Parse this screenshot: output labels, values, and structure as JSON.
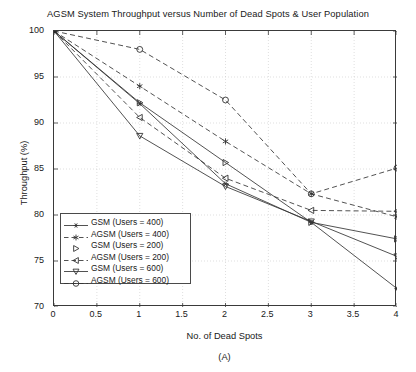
{
  "chart_data": {
    "type": "line",
    "title": "AGSM System Throughput versus Number of Dead Spots & User Population",
    "xlabel": "No. of Dead Spots",
    "ylabel": "Throughput (%)",
    "sub_caption": "(A)",
    "x": [
      0,
      1,
      2,
      3,
      4
    ],
    "xlim": [
      0,
      4
    ],
    "ylim": [
      70,
      100
    ],
    "xticks": [
      "0",
      "0.5",
      "1",
      "1.5",
      "2",
      "2.5",
      "3",
      "3.5",
      "4"
    ],
    "xtick_values": [
      0,
      0.5,
      1,
      1.5,
      2,
      2.5,
      3,
      3.5,
      4
    ],
    "yticks": [
      "70",
      "75",
      "80",
      "85",
      "90",
      "95",
      "100"
    ],
    "ytick_values": [
      70,
      75,
      80,
      85,
      90,
      95,
      100
    ],
    "grid": true,
    "legend_position": "lower left",
    "series": [
      {
        "name": "GSM (Users = 400)",
        "marker": "star",
        "linestyle": "solid",
        "color": "#333333",
        "values": [
          100,
          92.1,
          83.4,
          79.2,
          72.0
        ]
      },
      {
        "name": "AGSM (Users = 400)",
        "marker": "asterisk",
        "linestyle": "dashed",
        "color": "#333333",
        "values": [
          100,
          94.0,
          88.0,
          82.3,
          79.8
        ]
      },
      {
        "name": "GSM (Users = 200)",
        "marker": "triangle-right",
        "linestyle": "solid",
        "color": "#333333",
        "values": [
          100,
          92.2,
          85.7,
          79.2,
          77.4
        ]
      },
      {
        "name": "AGSM (Users = 200)",
        "marker": "triangle-left",
        "linestyle": "dashed",
        "color": "#333333",
        "values": [
          100,
          90.6,
          84.0,
          80.5,
          80.4
        ]
      },
      {
        "name": "GSM (Users = 600)",
        "marker": "triangle-down",
        "linestyle": "solid",
        "color": "#333333",
        "values": [
          100,
          88.6,
          83.1,
          79.3,
          75.5
        ]
      },
      {
        "name": "AGSM (Users = 600)",
        "marker": "circle",
        "linestyle": "dashed",
        "color": "#333333",
        "values": [
          100,
          98.0,
          92.5,
          82.3,
          85.1
        ]
      }
    ]
  },
  "legend": {
    "items": [
      "GSM (Users = 400)",
      "AGSM (Users = 400)",
      "GSM (Users = 200)",
      "AGSM (Users = 200)",
      "GSM (Users = 600)",
      "AGSM (Users = 600)"
    ]
  }
}
